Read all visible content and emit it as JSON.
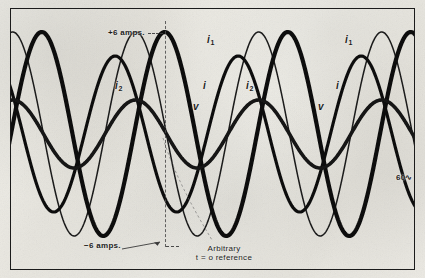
{
  "figure": {
    "background_color": "#f2f1ec",
    "ink_color": "#1b1b1b",
    "frame": {
      "x": 10,
      "y": 8,
      "width": 405,
      "height": 262
    }
  },
  "annotations": {
    "plus_amps": "+6 amps.",
    "minus_amps": "−6 amps.",
    "frequency": "60∿",
    "reference_line_1": "Arbitrary",
    "reference_line_2": "t = o reference"
  },
  "curve_labels": {
    "i1_left": "i",
    "i1_left_sub": "1",
    "i1_right": "i",
    "i1_right_sub": "1",
    "i2_left": "i",
    "i2_left_sub": "2",
    "i2_right": "i",
    "i2_right_sub": "2",
    "i_left": "i",
    "i_right": "i",
    "v_left": "v",
    "v_right": "v"
  },
  "chart_data": {
    "type": "line",
    "title": "",
    "xlabel": "",
    "ylabel": "amperes / volts",
    "xlim": [
      0,
      405
    ],
    "ylim": [
      -6.8,
      6.8
    ],
    "grid": false,
    "legend": "inline-curve-labels",
    "zero_axis_y_px": 125,
    "period_px": 123,
    "reference_line_x_px": 154,
    "y_ticks": [
      {
        "value": 6,
        "label": "+6 amps."
      },
      {
        "value": -6,
        "label": "−6 amps."
      }
    ],
    "series": [
      {
        "name": "i1",
        "label": "i₁",
        "stroke": "#111111",
        "stroke_width": 4.2,
        "amplitude_amps": 6.0,
        "amplitude_px": 102,
        "period_px": 123,
        "phase_deg": 0,
        "peak_x_px": [
          68,
          191,
          314
        ],
        "trough_x_px": [
          129,
          252,
          375
        ]
      },
      {
        "name": "i2",
        "label": "i₂",
        "stroke": "#1a1a1a",
        "stroke_width": 1.5,
        "amplitude_amps": 6.0,
        "amplitude_px": 102,
        "period_px": 123,
        "phase_deg": 85,
        "peak_x_px": [
          39,
          162,
          285
        ],
        "trough_x_px": [
          100,
          223,
          346
        ]
      },
      {
        "name": "i",
        "label": "i",
        "stroke": "#111111",
        "stroke_width": 3.2,
        "amplitude_amps": 4.6,
        "amplitude_px": 78,
        "period_px": 123,
        "phase_deg": 145,
        "peak_x_px": [
          18,
          141,
          264,
          387
        ],
        "trough_x_px": [
          79,
          202,
          325
        ]
      },
      {
        "name": "v",
        "label": "v",
        "stroke": "#131313",
        "stroke_width": 3.6,
        "amplitude_amps": 2.0,
        "amplitude_px": 34,
        "period_px": 123,
        "phase_deg": 85,
        "peak_x_px": [
          40,
          163,
          286
        ],
        "trough_x_px": [
          101,
          224,
          347
        ]
      }
    ]
  }
}
